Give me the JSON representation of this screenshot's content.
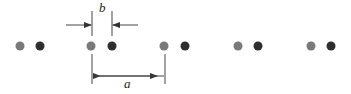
{
  "diagram": {
    "type": "1d-diatomic-chain",
    "labels": {
      "b": "b",
      "a": "a"
    },
    "colors": {
      "atom_type_1": "#7a7a7a",
      "atom_type_2": "#2e2e2e",
      "lines": "#444444"
    },
    "atoms": [
      {
        "x": 20,
        "type": 1
      },
      {
        "x": 40,
        "type": 2
      },
      {
        "x": 91,
        "type": 1
      },
      {
        "x": 112,
        "type": 2
      },
      {
        "x": 164,
        "type": 1
      },
      {
        "x": 185,
        "type": 2
      },
      {
        "x": 238,
        "type": 1
      },
      {
        "x": 258,
        "type": 2
      },
      {
        "x": 311,
        "type": 1
      },
      {
        "x": 331,
        "type": 2
      }
    ]
  }
}
